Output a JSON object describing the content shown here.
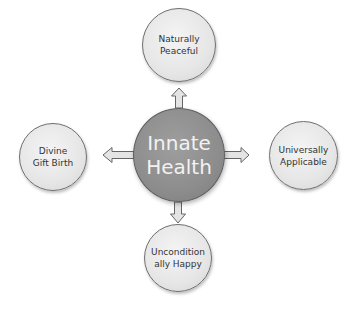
{
  "diagram": {
    "center": {
      "label": "Innate\nHealth",
      "color": "#8f8f8f"
    },
    "nodes": [
      {
        "id": "top",
        "label": "Naturally\nPeaceful"
      },
      {
        "id": "left",
        "label": "Divine\nGift Birth"
      },
      {
        "id": "right",
        "label": "Universally\nApplicable"
      },
      {
        "id": "bottom",
        "label": "Uncondition\nally Happy"
      }
    ],
    "satellite_color": "#e6e6e6",
    "arrow_color": "#e0e0e0"
  }
}
